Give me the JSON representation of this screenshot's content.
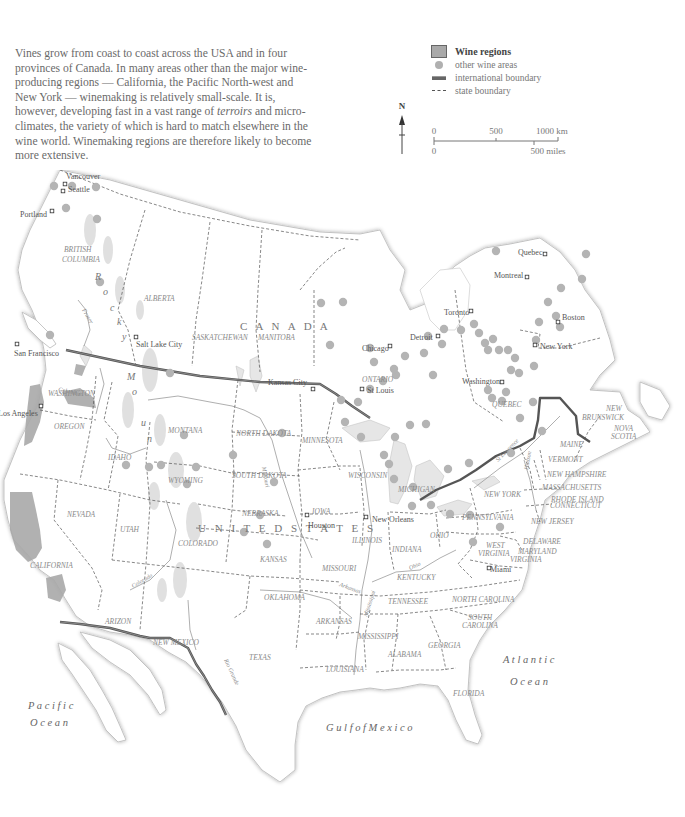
{
  "intro": {
    "parts": [
      "Vines grow from coast to coast across the USA and in four provinces of Canada. In many areas other than the major wine-producing regions — California, the Pacific North-west and New York — winemaking is relatively small-scale. It is, however, developing fast in a vast range of ",
      "terroirs",
      " and micro-climates, the variety of which is hard to match elsewhere in the wine world. Winemaking regions are therefore likely to become more extensive."
    ]
  },
  "legend": {
    "title": "Wine regions",
    "items": [
      {
        "symbol": "grey-dot",
        "label": "other wine areas"
      },
      {
        "symbol": "thick-line",
        "label": "international boundary"
      },
      {
        "symbol": "dashed-line",
        "label": "state boundary"
      }
    ]
  },
  "north_arrow": {
    "label": "N"
  },
  "scale_bar": {
    "km": [
      "0",
      "500",
      "1000 km"
    ],
    "miles": [
      "0",
      "500 miles"
    ]
  },
  "colors": {
    "wine_region": "#a9a9a9",
    "wine_dot": "#b4b4b4",
    "intl_boundary": "#555555",
    "state_boundary": "#555555",
    "water": "#e6e6e6",
    "label": "#777777"
  },
  "labels": {
    "countries": [
      {
        "text": "C  A  N  A  D  A",
        "x": 240,
        "y": 160
      },
      {
        "text": "U N I T E D     S T A T E S",
        "x": 198,
        "y": 362
      }
    ],
    "provinces": [
      {
        "text": "BRITISH",
        "x": 64,
        "y": 82
      },
      {
        "text": "COLUMBIA",
        "x": 62,
        "y": 92
      },
      {
        "text": "ALBERTA",
        "x": 144,
        "y": 131
      },
      {
        "text": "SASKATCHEWAN",
        "x": 192,
        "y": 170
      },
      {
        "text": "MANITOBA",
        "x": 258,
        "y": 170
      },
      {
        "text": "ONTARIO",
        "x": 362,
        "y": 212
      },
      {
        "text": "QUEBEC",
        "x": 492,
        "y": 237
      },
      {
        "text": "NEW",
        "x": 606,
        "y": 241
      },
      {
        "text": "BRUNSWICK",
        "x": 582,
        "y": 250
      },
      {
        "text": "NOVA",
        "x": 614,
        "y": 261
      },
      {
        "text": "SCOTIA",
        "x": 611,
        "y": 269
      }
    ],
    "states": [
      {
        "text": "WASHINGTON",
        "x": 48,
        "y": 226
      },
      {
        "text": "OREGON",
        "x": 54,
        "y": 259
      },
      {
        "text": "IDAHO",
        "x": 108,
        "y": 290
      },
      {
        "text": "MONTANA",
        "x": 168,
        "y": 263
      },
      {
        "text": "NORTH DAKOTA",
        "x": 236,
        "y": 266
      },
      {
        "text": "MINNESOTA",
        "x": 302,
        "y": 273
      },
      {
        "text": "WYOMING",
        "x": 168,
        "y": 313
      },
      {
        "text": "SOUTH DAKOTA",
        "x": 232,
        "y": 308
      },
      {
        "text": "WISCONSIN",
        "x": 348,
        "y": 308
      },
      {
        "text": "MICHIGAN",
        "x": 398,
        "y": 322
      },
      {
        "text": "NEVADA",
        "x": 67,
        "y": 347
      },
      {
        "text": "UTAH",
        "x": 120,
        "y": 362
      },
      {
        "text": "NEBRASKA",
        "x": 242,
        "y": 346
      },
      {
        "text": "IOWA",
        "x": 312,
        "y": 344
      },
      {
        "text": "COLORADO",
        "x": 178,
        "y": 376
      },
      {
        "text": "ILLINOIS",
        "x": 352,
        "y": 373
      },
      {
        "text": "INDIANA",
        "x": 392,
        "y": 382
      },
      {
        "text": "OHIO",
        "x": 430,
        "y": 368
      },
      {
        "text": "KANSAS",
        "x": 260,
        "y": 392
      },
      {
        "text": "MISSOURI",
        "x": 322,
        "y": 401
      },
      {
        "text": "KENTUCKY",
        "x": 397,
        "y": 410
      },
      {
        "text": "CALIFORNIA",
        "x": 30,
        "y": 398
      },
      {
        "text": "ARIZON",
        "x": 105,
        "y": 454
      },
      {
        "text": "NEW MEXICO",
        "x": 153,
        "y": 475
      },
      {
        "text": "OKLAHOMA",
        "x": 264,
        "y": 430
      },
      {
        "text": "ARKANSAS",
        "x": 316,
        "y": 454
      },
      {
        "text": "TENNESSEE",
        "x": 388,
        "y": 434
      },
      {
        "text": "NORTH CAROLINA",
        "x": 452,
        "y": 432
      },
      {
        "text": "SOUTH",
        "x": 468,
        "y": 450
      },
      {
        "text": "CAROLINA",
        "x": 462,
        "y": 458
      },
      {
        "text": "MISSISSIPPI",
        "x": 358,
        "y": 469
      },
      {
        "text": "ALABAMA",
        "x": 388,
        "y": 487
      },
      {
        "text": "GEORGIA",
        "x": 428,
        "y": 478
      },
      {
        "text": "TEXAS",
        "x": 249,
        "y": 490
      },
      {
        "text": "LOUISIANA",
        "x": 326,
        "y": 502
      },
      {
        "text": "FLORIDA",
        "x": 453,
        "y": 526
      },
      {
        "text": "PENNSYLVANIA",
        "x": 462,
        "y": 350
      },
      {
        "text": "NEW YORK",
        "x": 484,
        "y": 327
      },
      {
        "text": "VERMONT",
        "x": 548,
        "y": 292
      },
      {
        "text": "MAINE",
        "x": 560,
        "y": 277
      },
      {
        "text": "NEW HAMPSHIRE",
        "x": 547,
        "y": 307
      },
      {
        "text": "MASSACHUSETTS",
        "x": 542,
        "y": 320
      },
      {
        "text": "RHODE ISLAND",
        "x": 551,
        "y": 332
      },
      {
        "text": "CONNECTICUT",
        "x": 550,
        "y": 338
      },
      {
        "text": "NEW JERSEY",
        "x": 531,
        "y": 354
      },
      {
        "text": "DELAWARE",
        "x": 523,
        "y": 374
      },
      {
        "text": "MARYLAND",
        "x": 518,
        "y": 384
      },
      {
        "text": "WEST",
        "x": 486,
        "y": 378
      },
      {
        "text": "VIRGINIA",
        "x": 478,
        "y": 386
      },
      {
        "text": "VIRGINIA",
        "x": 510,
        "y": 392
      }
    ],
    "cities": [
      {
        "text": "Vancouver",
        "x": 66,
        "y": 176,
        "dx": 65,
        "dy": 184
      },
      {
        "text": "Seattle",
        "x": 68,
        "y": 189,
        "dx": 63,
        "dy": 191
      },
      {
        "text": "Portland",
        "x": 20,
        "y": 214,
        "dx": 52,
        "dy": 211
      },
      {
        "text": "San Francisco",
        "x": 14,
        "y": 353,
        "dx": 17,
        "dy": 344
      },
      {
        "text": "Los Angeles",
        "x": -2,
        "y": 413,
        "dx": 41,
        "dy": 406
      },
      {
        "text": "Salt Lake City",
        "x": 136,
        "y": 344,
        "dx": 136,
        "dy": 337
      },
      {
        "text": "Kansas City",
        "x": 268,
        "y": 382,
        "dx": 313,
        "dy": 389
      },
      {
        "text": "Chicago",
        "x": 362,
        "y": 348,
        "dx": 390,
        "dy": 346
      },
      {
        "text": "St Louis",
        "x": 367,
        "y": 390,
        "dx": 362,
        "dy": 389
      },
      {
        "text": "Detroit",
        "x": 410,
        "y": 337,
        "dx": 438,
        "dy": 336
      },
      {
        "text": "Toronto",
        "x": 444,
        "y": 312,
        "dx": 471,
        "dy": 311
      },
      {
        "text": "Montreal",
        "x": 494,
        "y": 275,
        "dx": 527,
        "dy": 277
      },
      {
        "text": "Quebec",
        "x": 518,
        "y": 252,
        "dx": 545,
        "dy": 254
      },
      {
        "text": "Boston",
        "x": 562,
        "y": 317,
        "dx": 558,
        "dy": 322
      },
      {
        "text": "New York",
        "x": 540,
        "y": 346,
        "dx": 535,
        "dy": 345
      },
      {
        "text": "Washington",
        "x": 462,
        "y": 381,
        "dx": 502,
        "dy": 382
      },
      {
        "text": "Houston",
        "x": 308,
        "y": 525,
        "dx": 307,
        "dy": 515
      },
      {
        "text": "New Orleans",
        "x": 372,
        "y": 519,
        "dx": 366,
        "dy": 517
      },
      {
        "text": "Miami",
        "x": 490,
        "y": 569,
        "dx": 489,
        "dy": 568
      }
    ],
    "water": [
      {
        "text": "P a c i f i c",
        "x": 28,
        "y": 539
      },
      {
        "text": "O c e a n",
        "x": 30,
        "y": 556
      },
      {
        "text": "A t l a n t i c",
        "x": 503,
        "y": 493
      },
      {
        "text": "O c e a n",
        "x": 510,
        "y": 515
      },
      {
        "text": "G u l f   o f   M e x i c o",
        "x": 326,
        "y": 561
      }
    ],
    "mountains": [
      {
        "text": "R",
        "x": 95,
        "y": 110
      },
      {
        "text": "o",
        "x": 103,
        "y": 125
      },
      {
        "text": "c",
        "x": 110,
        "y": 141
      },
      {
        "text": "k",
        "x": 117,
        "y": 155
      },
      {
        "text": "y",
        "x": 122,
        "y": 170
      },
      {
        "text": "M",
        "x": 127,
        "y": 210
      },
      {
        "text": "o",
        "x": 132,
        "y": 225
      },
      {
        "text": "u",
        "x": 141,
        "y": 256
      },
      {
        "text": "n",
        "x": 147,
        "y": 272
      }
    ],
    "rivers": [
      {
        "text": "Fraser",
        "x": 82,
        "y": 140,
        "rot": 60
      },
      {
        "text": "Columbia",
        "x": 58,
        "y": 221,
        "rot": 12
      },
      {
        "text": "Colorado",
        "x": 133,
        "y": 418,
        "rot": -30
      },
      {
        "text": "Missouri",
        "x": 262,
        "y": 297,
        "rot": 80
      },
      {
        "text": "Ohio",
        "x": 410,
        "y": 400,
        "rot": -25
      },
      {
        "text": "Mississippi",
        "x": 367,
        "y": 447,
        "rot": -72
      },
      {
        "text": "Arkansas",
        "x": 339,
        "y": 416,
        "rot": 20
      },
      {
        "text": "Rio Grande",
        "x": 224,
        "y": 490,
        "rot": 65
      },
      {
        "text": "Hudson",
        "x": 528,
        "y": 300,
        "rot": -80
      },
      {
        "text": "St Lawrence",
        "x": 498,
        "y": 292,
        "rot": -45
      }
    ]
  },
  "wine_dots": [
    [
      54,
      186
    ],
    [
      72,
      186
    ],
    [
      96,
      187
    ],
    [
      66,
      208
    ],
    [
      97,
      219
    ],
    [
      100,
      282
    ],
    [
      50,
      335
    ],
    [
      170,
      373
    ],
    [
      184,
      435
    ],
    [
      161,
      465
    ],
    [
      196,
      467
    ],
    [
      126,
      465
    ],
    [
      149,
      467
    ],
    [
      187,
      484
    ],
    [
      233,
      455
    ],
    [
      282,
      433
    ],
    [
      274,
      482
    ],
    [
      260,
      515
    ],
    [
      244,
      532
    ],
    [
      267,
      544
    ],
    [
      321,
      303
    ],
    [
      343,
      302
    ],
    [
      330,
      345
    ],
    [
      370,
      348
    ],
    [
      374,
      362
    ],
    [
      383,
      381
    ],
    [
      396,
      375
    ],
    [
      370,
      389
    ],
    [
      341,
      400
    ],
    [
      358,
      402
    ],
    [
      345,
      422
    ],
    [
      361,
      437
    ],
    [
      395,
      437
    ],
    [
      410,
      425
    ],
    [
      426,
      424
    ],
    [
      384,
      455
    ],
    [
      389,
      464
    ],
    [
      394,
      479
    ],
    [
      413,
      487
    ],
    [
      412,
      506
    ],
    [
      431,
      505
    ],
    [
      473,
      542
    ],
    [
      448,
      469
    ],
    [
      469,
      463
    ],
    [
      450,
      514
    ],
    [
      470,
      515
    ],
    [
      500,
      527
    ],
    [
      428,
      336
    ],
    [
      442,
      344
    ],
    [
      424,
      353
    ],
    [
      405,
      356
    ],
    [
      394,
      369
    ],
    [
      433,
      375
    ],
    [
      444,
      329
    ],
    [
      461,
      330
    ],
    [
      474,
      324
    ],
    [
      479,
      333
    ],
    [
      485,
      343
    ],
    [
      493,
      339
    ],
    [
      488,
      350
    ],
    [
      499,
      350
    ],
    [
      508,
      350
    ],
    [
      515,
      358
    ],
    [
      511,
      370
    ],
    [
      519,
      373
    ],
    [
      488,
      390
    ],
    [
      506,
      392
    ],
    [
      502,
      401
    ],
    [
      534,
      366
    ],
    [
      536,
      340
    ],
    [
      539,
      322
    ],
    [
      548,
      302
    ],
    [
      561,
      288
    ],
    [
      582,
      279
    ],
    [
      586,
      254
    ],
    [
      496,
      251
    ],
    [
      556,
      316
    ],
    [
      560,
      327
    ],
    [
      492,
      398
    ],
    [
      533,
      402
    ],
    [
      520,
      418
    ],
    [
      542,
      431
    ],
    [
      511,
      453
    ]
  ]
}
